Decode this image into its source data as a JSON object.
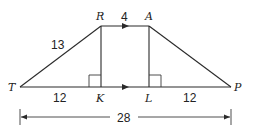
{
  "diagram": {
    "type": "isosceles-trapezoid",
    "vertices": {
      "T": "T",
      "R": "R",
      "A": "A",
      "P": "P",
      "K": "K",
      "L": "L"
    },
    "labels": {
      "top_base": "4",
      "leg_TR": "13",
      "segment_TK": "12",
      "segment_LP": "12",
      "bottom_base": "28"
    },
    "relations": {
      "parallel": [
        "RA",
        "TP"
      ],
      "right_angles": [
        "RKT",
        "ALP"
      ]
    }
  }
}
